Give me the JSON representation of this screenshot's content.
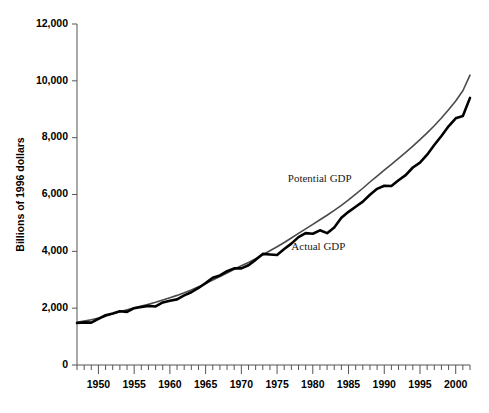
{
  "chart_data": {
    "type": "line",
    "title": "",
    "xlabel": "",
    "ylabel": "Billions of 1996 dollars",
    "xlim": [
      1947,
      2002
    ],
    "ylim": [
      0,
      12000
    ],
    "grid": false,
    "legend_position": "inline-annotation",
    "ytick_labels": [
      "12,000",
      "10,000",
      "8,000",
      "6,000",
      "4,000",
      "2,000",
      "0"
    ],
    "ytick_values": [
      12000,
      10000,
      8000,
      6000,
      4000,
      2000,
      0
    ],
    "xtick_labels": [
      "1950",
      "1955",
      "1960",
      "1965",
      "1970",
      "1975",
      "1980",
      "1985",
      "1990",
      "1995",
      "2000"
    ],
    "xtick_values": [
      1950,
      1955,
      1960,
      1965,
      1970,
      1975,
      1980,
      1985,
      1990,
      1995,
      2000
    ],
    "xtick_minor_step": 1,
    "annotations": [
      {
        "name": "potential-gdp-label",
        "text": "Potential GDP",
        "x": 1976.5,
        "y": 6450
      },
      {
        "name": "actual-gdp-label",
        "text": "Actual GDP",
        "x": 1977.0,
        "y": 4050
      }
    ],
    "colors": {
      "actual": "#000000",
      "potential": "#4a4a4a",
      "axis": "#555555",
      "text": "#000000"
    },
    "x": [
      1947,
      1948,
      1949,
      1950,
      1951,
      1952,
      1953,
      1954,
      1955,
      1956,
      1957,
      1958,
      1959,
      1960,
      1961,
      1962,
      1963,
      1964,
      1965,
      1966,
      1967,
      1968,
      1969,
      1970,
      1971,
      1972,
      1973,
      1974,
      1975,
      1976,
      1977,
      1978,
      1979,
      1980,
      1981,
      1982,
      1983,
      1984,
      1985,
      1986,
      1987,
      1988,
      1989,
      1990,
      1991,
      1992,
      1993,
      1994,
      1995,
      1996,
      1997,
      1998,
      1999,
      2000,
      2001,
      2002
    ],
    "series": [
      {
        "name": "Actual GDP",
        "values": [
          1480,
          1500,
          1490,
          1620,
          1750,
          1810,
          1890,
          1870,
          2000,
          2040,
          2080,
          2060,
          2200,
          2260,
          2310,
          2450,
          2560,
          2710,
          2880,
          3070,
          3150,
          3300,
          3400,
          3400,
          3510,
          3700,
          3910,
          3890,
          3870,
          4080,
          4270,
          4500,
          4640,
          4620,
          4740,
          4640,
          4840,
          5180,
          5390,
          5570,
          5750,
          5990,
          6200,
          6310,
          6300,
          6500,
          6680,
          6950,
          7120,
          7400,
          7740,
          8060,
          8400,
          8680,
          8760,
          9400
        ]
      },
      {
        "name": "Potential GDP",
        "values": [
          1500,
          1545,
          1595,
          1650,
          1720,
          1800,
          1875,
          1940,
          2010,
          2075,
          2140,
          2210,
          2290,
          2370,
          2450,
          2540,
          2640,
          2750,
          2870,
          2990,
          3110,
          3240,
          3370,
          3490,
          3610,
          3740,
          3880,
          4020,
          4160,
          4310,
          4470,
          4630,
          4790,
          4950,
          5110,
          5270,
          5440,
          5620,
          5810,
          6010,
          6220,
          6440,
          6650,
          6860,
          7060,
          7270,
          7480,
          7700,
          7930,
          8170,
          8420,
          8690,
          8980,
          9290,
          9650,
          10200
        ]
      }
    ]
  },
  "axis_titles": {
    "y": "Billions of 1996 dollars"
  }
}
